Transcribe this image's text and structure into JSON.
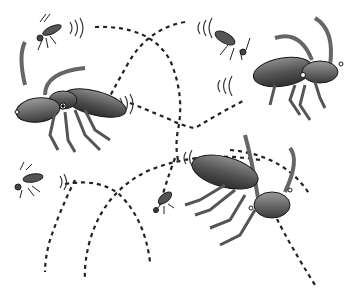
{
  "illustration": {
    "description": "Grayscale cartoon of flying insects (large ant/beetle-like bugs and small mosquitoes) with dashed flight-path arcs crossing between them",
    "palette": {
      "background": "#ffffff",
      "body_dark": "#3a3a3a",
      "body_mid": "#6b6b6b",
      "body_light": "#9a9a9a",
      "outline": "#1a1a1a",
      "path": "#222222"
    },
    "large_insects": [
      {
        "name": "top-left-insect",
        "x": 75,
        "y": 105
      },
      {
        "name": "top-right-insect",
        "x": 295,
        "y": 75
      },
      {
        "name": "bottom-right-insect",
        "x": 240,
        "y": 185
      }
    ],
    "small_insects": [
      {
        "name": "mosquito-top-left",
        "x": 48,
        "y": 33
      },
      {
        "name": "mosquito-top-center",
        "x": 232,
        "y": 42
      },
      {
        "name": "mosquito-left",
        "x": 25,
        "y": 183
      },
      {
        "name": "mosquito-center",
        "x": 160,
        "y": 205
      }
    ]
  }
}
